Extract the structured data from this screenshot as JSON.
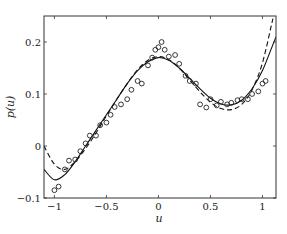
{
  "chart_data": {
    "type": "line",
    "title": "",
    "xlabel": "u",
    "ylabel": "p(u)",
    "xlim": [
      -1.1,
      1.13
    ],
    "ylim": [
      -0.1,
      0.25
    ],
    "xticks": [
      -1,
      -0.5,
      0,
      0.5,
      1
    ],
    "xtick_labels": [
      "−1",
      "−0.5",
      "0",
      "0.5",
      "1"
    ],
    "yticks": [
      -0.1,
      0,
      0.1,
      0.2
    ],
    "ytick_labels": [
      "−0.1",
      "0",
      "0.1",
      "0.2"
    ],
    "grid": false,
    "legend": null,
    "series": [
      {
        "name": "solid-fit",
        "style": "solid",
        "x": [
          -1.1,
          -1.0,
          -0.9,
          -0.8,
          -0.7,
          -0.6,
          -0.5,
          -0.4,
          -0.3,
          -0.2,
          -0.1,
          0.0,
          0.1,
          0.2,
          0.3,
          0.4,
          0.5,
          0.6,
          0.7,
          0.8,
          0.9,
          1.0,
          1.1,
          1.13
        ],
        "y": [
          -0.045,
          -0.065,
          -0.055,
          -0.03,
          0.0,
          0.03,
          0.06,
          0.09,
          0.12,
          0.145,
          0.162,
          0.17,
          0.165,
          0.15,
          0.13,
          0.11,
          0.092,
          0.081,
          0.079,
          0.088,
          0.11,
          0.145,
          0.195,
          0.21
        ]
      },
      {
        "name": "dashed-fit",
        "style": "dashed",
        "x": [
          -1.1,
          -1.0,
          -0.9,
          -0.8,
          -0.7,
          -0.6,
          -0.5,
          -0.4,
          -0.3,
          -0.2,
          -0.1,
          0.0,
          0.1,
          0.2,
          0.3,
          0.4,
          0.5,
          0.6,
          0.7,
          0.8,
          0.9,
          1.0,
          1.1
        ],
        "y": [
          0.0,
          -0.035,
          -0.045,
          -0.03,
          -0.005,
          0.025,
          0.058,
          0.09,
          0.12,
          0.147,
          0.165,
          0.172,
          0.166,
          0.15,
          0.127,
          0.104,
          0.084,
          0.072,
          0.07,
          0.08,
          0.108,
          0.16,
          0.245
        ]
      },
      {
        "name": "samples",
        "style": "markers",
        "marker": "circle-open",
        "x": [
          -1.0,
          -0.96,
          -0.9,
          -0.86,
          -0.8,
          -0.75,
          -0.7,
          -0.66,
          -0.6,
          -0.56,
          -0.5,
          -0.46,
          -0.42,
          -0.36,
          -0.3,
          -0.26,
          -0.2,
          -0.16,
          -0.1,
          -0.06,
          -0.03,
          0.0,
          0.03,
          0.06,
          0.1,
          0.16,
          0.2,
          0.26,
          0.3,
          0.36,
          0.4,
          0.46,
          0.5,
          0.56,
          0.6,
          0.66,
          0.7,
          0.76,
          0.8,
          0.86,
          0.9,
          0.96,
          1.0,
          1.03
        ],
        "y": [
          -0.085,
          -0.078,
          -0.045,
          -0.028,
          -0.026,
          -0.01,
          0.005,
          0.02,
          0.02,
          0.04,
          0.045,
          0.06,
          0.075,
          0.08,
          0.09,
          0.108,
          0.125,
          0.12,
          0.155,
          0.17,
          0.185,
          0.19,
          0.2,
          0.185,
          0.172,
          0.175,
          0.158,
          0.135,
          0.125,
          0.12,
          0.08,
          0.074,
          0.09,
          0.078,
          0.085,
          0.08,
          0.083,
          0.088,
          0.09,
          0.09,
          0.1,
          0.105,
          0.12,
          0.125
        ]
      }
    ]
  }
}
